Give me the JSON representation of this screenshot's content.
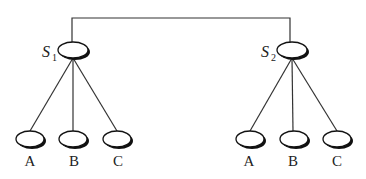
{
  "diagram": {
    "type": "tree",
    "servers": [
      {
        "id": "S1",
        "label": "S",
        "subscript": "1",
        "children": [
          "A",
          "B",
          "C"
        ]
      },
      {
        "id": "S2",
        "label": "S",
        "subscript": "2",
        "children": [
          "A",
          "B",
          "C"
        ]
      }
    ],
    "connection": "S1-S2"
  },
  "left": {
    "server_label": "S",
    "server_sub": "1",
    "children": [
      {
        "label": "A"
      },
      {
        "label": "B"
      },
      {
        "label": "C"
      }
    ]
  },
  "right": {
    "server_label": "S",
    "server_sub": "2",
    "children": [
      {
        "label": "A"
      },
      {
        "label": "B"
      },
      {
        "label": "C"
      }
    ]
  }
}
